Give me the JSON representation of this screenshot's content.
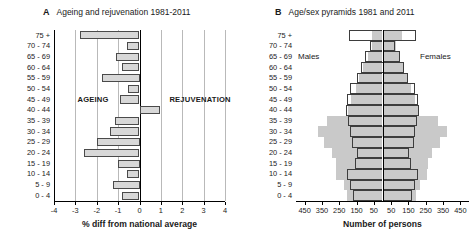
{
  "figure": {
    "panels": [
      {
        "letter": "A",
        "title": "Ageing and rejuvenation 1981-2011"
      },
      {
        "letter": "B",
        "title": "Age/sex pyramids 1981 and 2011"
      }
    ]
  },
  "chart_data": [
    {
      "type": "bar",
      "orientation": "horizontal",
      "panel": "A",
      "title": "Ageing and rejuvenation 1981-2011",
      "xlabel": "% diff from national average",
      "ylabel": "",
      "xlim": [
        -4,
        4
      ],
      "xticks": [
        -4,
        -3,
        -2,
        -1,
        0,
        1,
        2,
        3,
        4
      ],
      "xticklabels": [
        "-4",
        "-3",
        "-2",
        "-1",
        "0",
        "1",
        "2",
        "3",
        "4"
      ],
      "grid": true,
      "categories": [
        "75 +",
        "70 - 74",
        "65 - 69",
        "60 - 64",
        "55 - 59",
        "50 - 54",
        "45 - 49",
        "40 - 44",
        "35 - 39",
        "30 - 34",
        "25 - 29",
        "20 - 24",
        "15 - 19",
        "10 - 14",
        "5 - 9",
        "0 - 4"
      ],
      "values": [
        -2.8,
        -0.6,
        -1.1,
        -0.8,
        -1.75,
        -0.55,
        -0.9,
        0.95,
        -1.15,
        -1.4,
        -2.0,
        -2.6,
        -1.0,
        -0.6,
        -1.25,
        -0.8
      ],
      "annotations": [
        {
          "text": "AGEING",
          "x": -2.9,
          "category": "45 - 49"
        },
        {
          "text": "REJUVENATION",
          "x": 1.4,
          "category": "45 - 49"
        }
      ],
      "bar_fill": "#d8d8d8",
      "bar_edge": "#4a4a4a"
    },
    {
      "type": "bar",
      "orientation": "horizontal-pyramid",
      "panel": "B",
      "title": "Age/sex pyramids 1981 and 2011",
      "xlabel": "Number of persons",
      "ylabel": "",
      "xticks": [
        -450,
        -350,
        -250,
        -150,
        -50,
        50,
        150,
        250,
        350,
        450
      ],
      "xticklabels": [
        "450",
        "350",
        "250",
        "150",
        "50",
        "50",
        "150",
        "250",
        "350",
        "450"
      ],
      "xlim": [
        -500,
        500
      ],
      "grid": false,
      "side_labels": {
        "left": "Males",
        "right": "Females"
      },
      "categories": [
        "75 +",
        "70 - 74",
        "65 - 69",
        "60 - 64",
        "55 - 59",
        "50 - 54",
        "45 - 49",
        "40 - 44",
        "35 - 39",
        "30 - 34",
        "25 - 29",
        "20 - 24",
        "15 - 19",
        "10 - 14",
        "5 - 9",
        "0 - 4"
      ],
      "series": [
        {
          "name": "1981",
          "style": "filled-grey",
          "color": "#c9c9c9",
          "males": [
            60,
            60,
            85,
            110,
            135,
            155,
            180,
            200,
            320,
            375,
            340,
            290,
            270,
            270,
            225,
            205
          ],
          "females": [
            115,
            80,
            100,
            120,
            145,
            165,
            185,
            210,
            320,
            370,
            330,
            285,
            265,
            260,
            215,
            195
          ]
        },
        {
          "name": "2011",
          "style": "outline-white",
          "color": "#ffffff",
          "males": [
            195,
            75,
            100,
            125,
            145,
            190,
            205,
            210,
            200,
            185,
            175,
            150,
            160,
            205,
            185,
            170
          ],
          "females": [
            195,
            75,
            100,
            125,
            150,
            190,
            205,
            210,
            200,
            185,
            180,
            155,
            165,
            205,
            185,
            170
          ]
        }
      ]
    }
  ]
}
